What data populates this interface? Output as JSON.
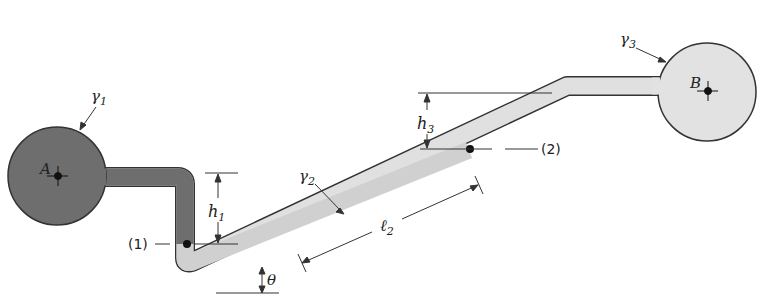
{
  "figure": {
    "type": "manometer-diagram",
    "colors": {
      "fluid1": "#6e6e6e",
      "fluid2": "#d4d4d4",
      "fluid3": "#e2e2e2",
      "outline": "#333333",
      "background": "#ffffff"
    },
    "labels": {
      "gamma1": "γ",
      "gamma1_sub": "1",
      "gamma2": "γ",
      "gamma2_sub": "2",
      "gamma3": "γ",
      "gamma3_sub": "3",
      "pointA": "A",
      "pointB": "B",
      "h1": "h",
      "h1_sub": "1",
      "h3": "h",
      "h3_sub": "3",
      "l2": "ℓ",
      "l2_sub": "2",
      "theta": "θ",
      "point1": "(1)",
      "point2": "(2)"
    }
  }
}
